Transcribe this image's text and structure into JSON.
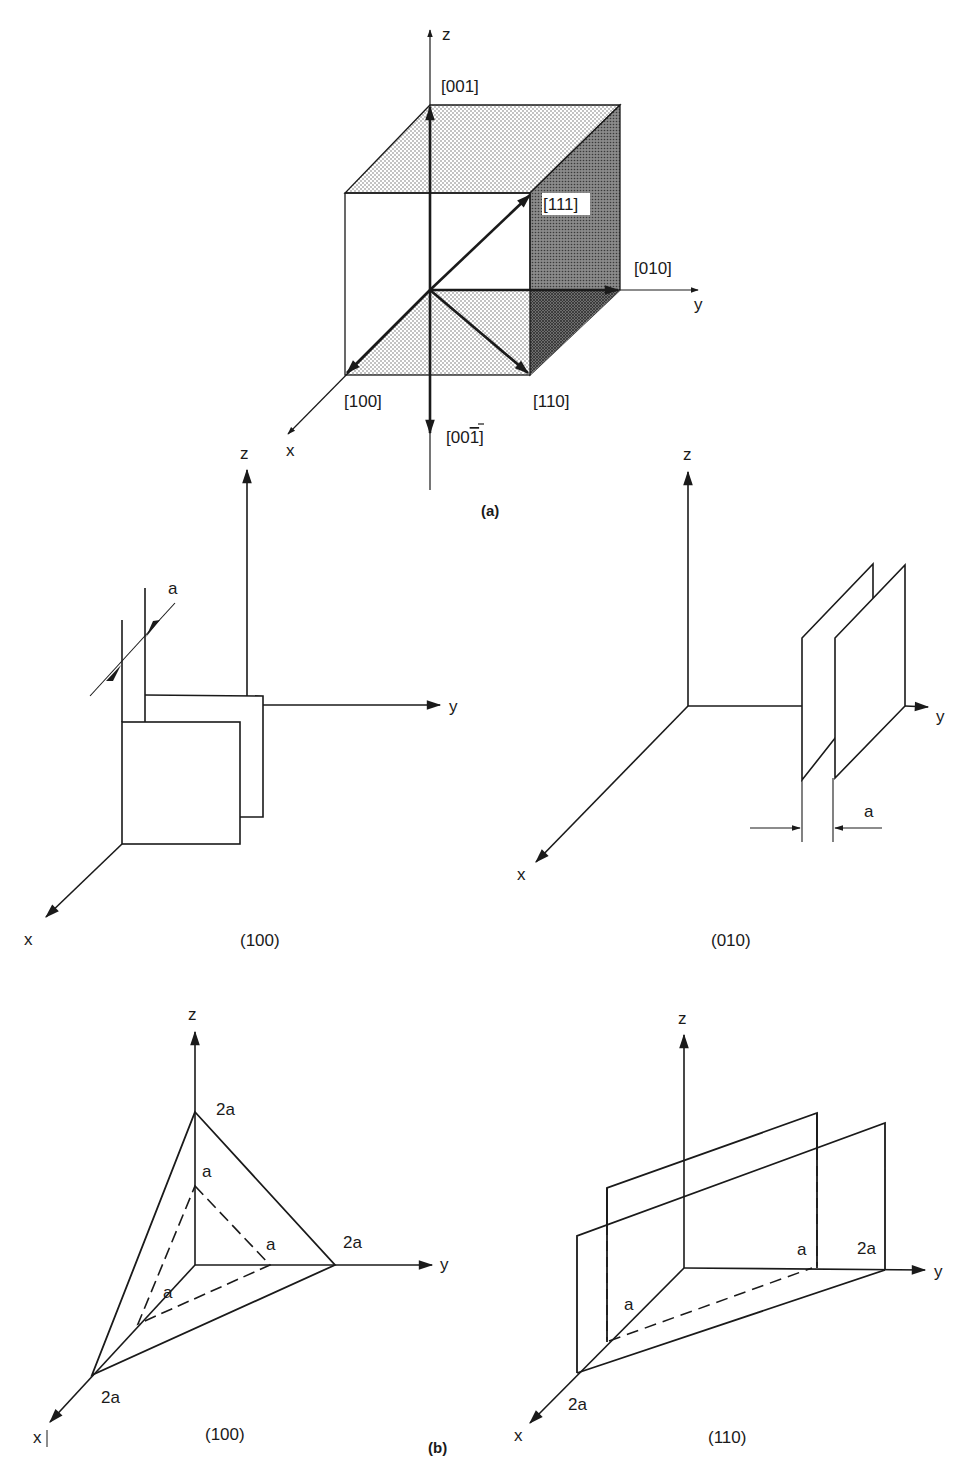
{
  "figure": {
    "panel_a": {
      "caption": "(a)",
      "axes": {
        "x": "x",
        "y": "y",
        "z": "z"
      },
      "directions": {
        "d001": "[001]",
        "d111": "[111]",
        "d010": "[010]",
        "d100": "[100]",
        "d110": "[110]",
        "d00_1bar_prefix": "[00",
        "d00_1bar_digit": "1",
        "d00_1bar_suffix": "]"
      }
    },
    "panel_b": {
      "caption": "(b)",
      "plane_100_parallel": {
        "caption": "(100)",
        "axes": {
          "x": "x",
          "y": "y",
          "z": "z"
        },
        "spacing_label": "a"
      },
      "plane_010_parallel": {
        "caption": "(010)",
        "axes": {
          "x": "x",
          "y": "y",
          "z": "z"
        },
        "spacing_label": "a"
      },
      "plane_100_intercepts": {
        "caption": "(100)",
        "axes": {
          "x": "x",
          "y": "y",
          "z": "z"
        },
        "outer_intercepts": {
          "x": "2a",
          "y": "2a",
          "z": "2a"
        },
        "inner_intercepts": {
          "x": "a",
          "y": "a",
          "z": "a"
        }
      },
      "plane_110": {
        "caption": "(110)",
        "axes": {
          "x": "x",
          "y": "y",
          "z": "z"
        },
        "intercepts": {
          "x_inner": "a",
          "x_outer": "2a",
          "y_inner": "a",
          "y_outer": "2a"
        }
      }
    }
  }
}
